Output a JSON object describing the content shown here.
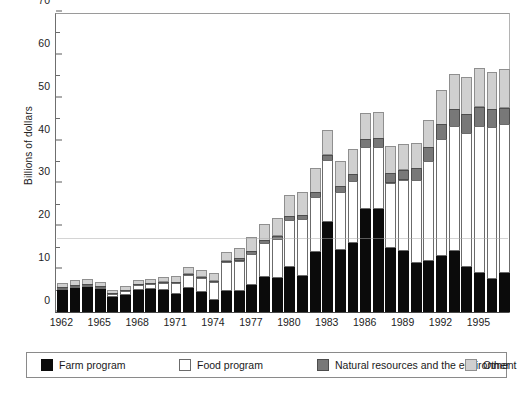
{
  "chart_data": {
    "type": "bar",
    "stacked": true,
    "title": "",
    "xlabel": "",
    "ylabel": "Billions of dollars",
    "ylim": [
      0,
      70
    ],
    "ytick_values": [
      0,
      10,
      20,
      30,
      40,
      50,
      60,
      70
    ],
    "ytick_labels": [
      "0",
      "10",
      "20",
      "30",
      "40",
      "50",
      "60",
      "70"
    ],
    "yminor_values": [
      5,
      15,
      25,
      35,
      45,
      55,
      65
    ],
    "grid": false,
    "legend_position": "below-axes",
    "categories": [
      "1962",
      "1963",
      "1964",
      "1965",
      "1966",
      "1967",
      "1968",
      "1969",
      "1970",
      "1971",
      "1972",
      "1973",
      "1974",
      "1975",
      "1976",
      "1977",
      "1978",
      "1979",
      "1980",
      "1981",
      "1982",
      "1983",
      "1984",
      "1985",
      "1986",
      "1987",
      "1988",
      "1989",
      "1990",
      "1991",
      "1992",
      "1993",
      "1994",
      "1995",
      "1996",
      "1997"
    ],
    "xtick_labels": [
      "1962",
      "1965",
      "1968",
      "1971",
      "1974",
      "1977",
      "1980",
      "1983",
      "1986",
      "1989",
      "1992",
      "1995"
    ],
    "xtick_categories": [
      "1962",
      "1965",
      "1968",
      "1971",
      "1974",
      "1977",
      "1980",
      "1983",
      "1986",
      "1989",
      "1992",
      "1995"
    ],
    "series": [
      {
        "name": "Farm program",
        "color": "#0b0b0b",
        "values": [
          5.1,
          5.6,
          5.8,
          5.3,
          3.5,
          4.0,
          5.2,
          5.4,
          5.2,
          4.2,
          5.5,
          4.7,
          2.7,
          5.0,
          4.8,
          6.2,
          8.2,
          7.9,
          10.5,
          8.3,
          14.1,
          21.1,
          14.4,
          16.1,
          24.1,
          24.0,
          14.9,
          14.3,
          11.4,
          12.0,
          13.1,
          14.3,
          10.5,
          9.1,
          7.8,
          9.1
        ]
      },
      {
        "name": "Food program",
        "color": "#ffffff",
        "values": [
          0.4,
          0.4,
          0.5,
          0.5,
          0.6,
          0.9,
          1.0,
          1.1,
          1.6,
          2.5,
          3.2,
          3.3,
          4.3,
          6.6,
          7.2,
          7.4,
          7.9,
          9.1,
          11.0,
          13.3,
          12.8,
          14.3,
          13.6,
          14.4,
          14.4,
          14.4,
          15.3,
          16.6,
          19.4,
          23.3,
          27.3,
          29.0,
          31.2,
          34.2,
          35.3,
          34.7
        ]
      },
      {
        "name": "Natural resources and the environment",
        "color": "#787878",
        "values": [
          0.3,
          0.3,
          0.3,
          0.3,
          0.3,
          0.3,
          0.3,
          0.3,
          0.3,
          0.4,
          0.4,
          0.4,
          0.5,
          0.6,
          0.7,
          0.8,
          0.9,
          1.0,
          1.1,
          1.2,
          1.3,
          1.5,
          1.6,
          1.9,
          2.1,
          2.3,
          2.4,
          2.5,
          2.9,
          3.4,
          3.6,
          4.2,
          4.6,
          4.8,
          4.4,
          4.1
        ]
      },
      {
        "name": "Other",
        "color": "#d0d0d0",
        "values": [
          1.0,
          1.2,
          1.2,
          1.1,
          1.0,
          1.1,
          1.2,
          1.2,
          1.3,
          1.5,
          1.6,
          1.7,
          1.9,
          2.2,
          2.6,
          3.4,
          3.9,
          4.4,
          5.0,
          5.5,
          5.8,
          6.0,
          6.1,
          6.0,
          6.3,
          6.4,
          6.4,
          6.2,
          6.1,
          6.5,
          8.2,
          8.3,
          9.0,
          9.2,
          8.9,
          9.1
        ]
      }
    ]
  },
  "legend": {
    "items": [
      {
        "label": "Farm program",
        "swatch": "sw-farm"
      },
      {
        "label": "Food program",
        "swatch": "sw-food"
      },
      {
        "label": "Natural resources and the environment",
        "swatch": "sw-nat"
      },
      {
        "label": "Other",
        "swatch": "sw-other"
      }
    ]
  }
}
